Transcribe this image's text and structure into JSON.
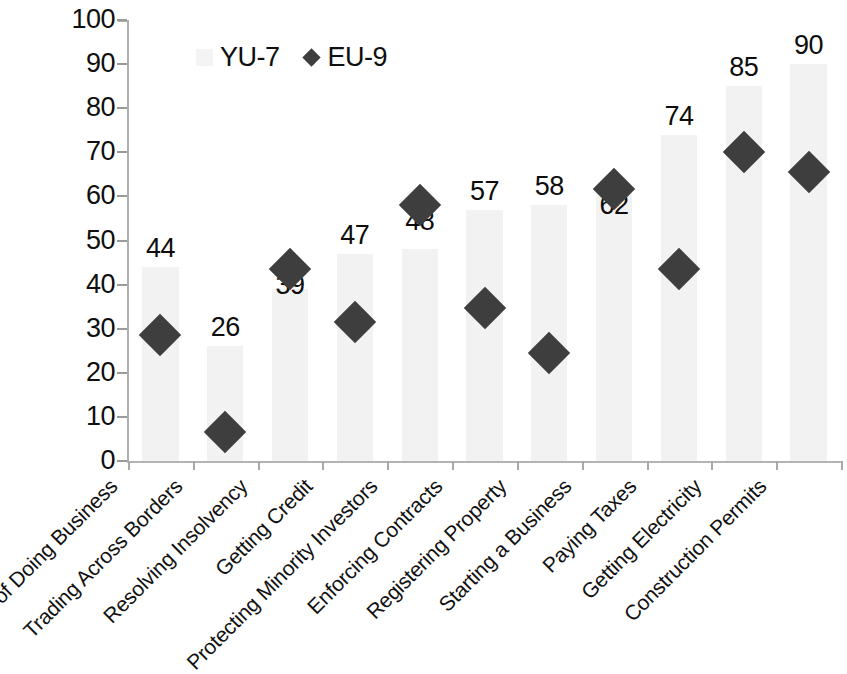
{
  "chart_data": {
    "type": "bar",
    "title": "",
    "subtitle": "",
    "xlabel": "",
    "ylabel": "",
    "ylim": [
      0,
      100
    ],
    "ytick_step": 10,
    "yticks": [
      "100",
      "90",
      "80",
      "70",
      "60",
      "50",
      "40",
      "30",
      "20",
      "10",
      "0"
    ],
    "grid": false,
    "legend_position": "top-left inside plot",
    "categories": [
      "Ease of Doing Business",
      "Trading Across Borders",
      "Resolving Insolvency",
      "Getting Credit",
      "Protecting Minority Investors",
      "Enforcing Contracts",
      "Registering Property",
      "Starting a Business",
      "Paying Taxes",
      "Getting Electricity",
      "Construction Permits"
    ],
    "series": [
      {
        "name": "YU-7",
        "render": "bar",
        "color": "#f2f2f2",
        "values": [
          44,
          26,
          39,
          47,
          48,
          57,
          58,
          62,
          74,
          85,
          90
        ],
        "data_labels": [
          "44",
          "26",
          "39",
          "47",
          "48",
          "57",
          "58",
          "62",
          "74",
          "85",
          "90"
        ]
      },
      {
        "name": "EU-9",
        "render": "diamond-marker",
        "color": "#3e3e3e",
        "values": [
          32,
          10,
          47,
          35,
          61.5,
          38,
          28,
          65,
          47,
          73.5,
          69
        ]
      }
    ]
  },
  "legend": {
    "items": [
      {
        "label": "YU-7",
        "marker": "bar-swatch-icon"
      },
      {
        "label": "EU-9",
        "marker": "diamond-marker-icon"
      }
    ]
  },
  "colors": {
    "bar_fill": "#f2f2f2",
    "marker_fill": "#3e3e3e",
    "axis": "#aeaeae",
    "text": "#0f0f0f"
  }
}
